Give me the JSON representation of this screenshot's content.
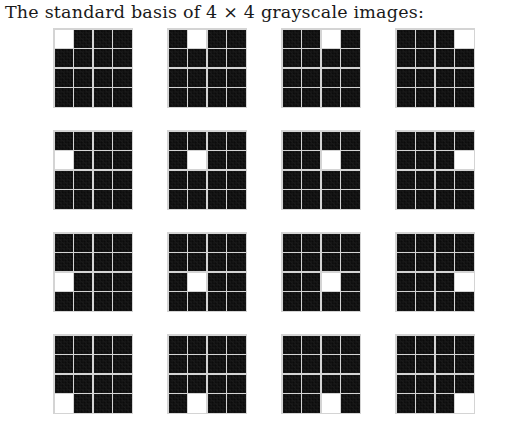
{
  "caption": {
    "text": "The standard basis of 4 × 4 grayscale images:"
  },
  "figure": {
    "grid_rows": 4,
    "grid_cols": 4,
    "image_rows": 4,
    "image_cols": 4,
    "on_color": "#ffffff",
    "off_color": "#0b0b0b",
    "gridline_color": "#d4d4d4",
    "background_color": "#ffffff"
  },
  "chart_data": {
    "type": "heatmap",
    "title": "The standard basis of 4 × 4 grayscale images:",
    "xlabel": "",
    "ylabel": "",
    "panel_layout": [
      4,
      4
    ],
    "matrix_shape": [
      4,
      4
    ],
    "value_range": [
      0,
      1
    ],
    "panels": [
      {
        "name": "E11",
        "panel_row": 0,
        "panel_col": 0,
        "on_pixel": [
          0,
          0
        ],
        "values": [
          [
            1,
            0,
            0,
            0
          ],
          [
            0,
            0,
            0,
            0
          ],
          [
            0,
            0,
            0,
            0
          ],
          [
            0,
            0,
            0,
            0
          ]
        ]
      },
      {
        "name": "E12",
        "panel_row": 0,
        "panel_col": 1,
        "on_pixel": [
          0,
          1
        ],
        "values": [
          [
            0,
            1,
            0,
            0
          ],
          [
            0,
            0,
            0,
            0
          ],
          [
            0,
            0,
            0,
            0
          ],
          [
            0,
            0,
            0,
            0
          ]
        ]
      },
      {
        "name": "E13",
        "panel_row": 0,
        "panel_col": 2,
        "on_pixel": [
          0,
          2
        ],
        "values": [
          [
            0,
            0,
            1,
            0
          ],
          [
            0,
            0,
            0,
            0
          ],
          [
            0,
            0,
            0,
            0
          ],
          [
            0,
            0,
            0,
            0
          ]
        ]
      },
      {
        "name": "E14",
        "panel_row": 0,
        "panel_col": 3,
        "on_pixel": [
          0,
          3
        ],
        "values": [
          [
            0,
            0,
            0,
            1
          ],
          [
            0,
            0,
            0,
            0
          ],
          [
            0,
            0,
            0,
            0
          ],
          [
            0,
            0,
            0,
            0
          ]
        ]
      },
      {
        "name": "E21",
        "panel_row": 1,
        "panel_col": 0,
        "on_pixel": [
          1,
          0
        ],
        "values": [
          [
            0,
            0,
            0,
            0
          ],
          [
            1,
            0,
            0,
            0
          ],
          [
            0,
            0,
            0,
            0
          ],
          [
            0,
            0,
            0,
            0
          ]
        ]
      },
      {
        "name": "E22",
        "panel_row": 1,
        "panel_col": 1,
        "on_pixel": [
          1,
          1
        ],
        "values": [
          [
            0,
            0,
            0,
            0
          ],
          [
            0,
            1,
            0,
            0
          ],
          [
            0,
            0,
            0,
            0
          ],
          [
            0,
            0,
            0,
            0
          ]
        ]
      },
      {
        "name": "E23",
        "panel_row": 1,
        "panel_col": 2,
        "on_pixel": [
          1,
          2
        ],
        "values": [
          [
            0,
            0,
            0,
            0
          ],
          [
            0,
            0,
            1,
            0
          ],
          [
            0,
            0,
            0,
            0
          ],
          [
            0,
            0,
            0,
            0
          ]
        ]
      },
      {
        "name": "E24",
        "panel_row": 1,
        "panel_col": 3,
        "on_pixel": [
          1,
          3
        ],
        "values": [
          [
            0,
            0,
            0,
            0
          ],
          [
            0,
            0,
            0,
            1
          ],
          [
            0,
            0,
            0,
            0
          ],
          [
            0,
            0,
            0,
            0
          ]
        ]
      },
      {
        "name": "E31",
        "panel_row": 2,
        "panel_col": 0,
        "on_pixel": [
          2,
          0
        ],
        "values": [
          [
            0,
            0,
            0,
            0
          ],
          [
            0,
            0,
            0,
            0
          ],
          [
            1,
            0,
            0,
            0
          ],
          [
            0,
            0,
            0,
            0
          ]
        ]
      },
      {
        "name": "E32",
        "panel_row": 2,
        "panel_col": 1,
        "on_pixel": [
          2,
          1
        ],
        "values": [
          [
            0,
            0,
            0,
            0
          ],
          [
            0,
            0,
            0,
            0
          ],
          [
            0,
            1,
            0,
            0
          ],
          [
            0,
            0,
            0,
            0
          ]
        ]
      },
      {
        "name": "E33",
        "panel_row": 2,
        "panel_col": 2,
        "on_pixel": [
          2,
          2
        ],
        "values": [
          [
            0,
            0,
            0,
            0
          ],
          [
            0,
            0,
            0,
            0
          ],
          [
            0,
            0,
            1,
            0
          ],
          [
            0,
            0,
            0,
            0
          ]
        ]
      },
      {
        "name": "E34",
        "panel_row": 2,
        "panel_col": 3,
        "on_pixel": [
          2,
          3
        ],
        "values": [
          [
            0,
            0,
            0,
            0
          ],
          [
            0,
            0,
            0,
            0
          ],
          [
            0,
            0,
            0,
            1
          ],
          [
            0,
            0,
            0,
            0
          ]
        ]
      },
      {
        "name": "E41",
        "panel_row": 3,
        "panel_col": 0,
        "on_pixel": [
          3,
          0
        ],
        "values": [
          [
            0,
            0,
            0,
            0
          ],
          [
            0,
            0,
            0,
            0
          ],
          [
            0,
            0,
            0,
            0
          ],
          [
            1,
            0,
            0,
            0
          ]
        ]
      },
      {
        "name": "E42",
        "panel_row": 3,
        "panel_col": 1,
        "on_pixel": [
          3,
          1
        ],
        "values": [
          [
            0,
            0,
            0,
            0
          ],
          [
            0,
            0,
            0,
            0
          ],
          [
            0,
            0,
            0,
            0
          ],
          [
            0,
            1,
            0,
            0
          ]
        ]
      },
      {
        "name": "E43",
        "panel_row": 3,
        "panel_col": 2,
        "on_pixel": [
          3,
          2
        ],
        "values": [
          [
            0,
            0,
            0,
            0
          ],
          [
            0,
            0,
            0,
            0
          ],
          [
            0,
            0,
            0,
            0
          ],
          [
            0,
            0,
            1,
            0
          ]
        ]
      },
      {
        "name": "E44",
        "panel_row": 3,
        "panel_col": 3,
        "on_pixel": [
          3,
          3
        ],
        "values": [
          [
            0,
            0,
            0,
            0
          ],
          [
            0,
            0,
            0,
            0
          ],
          [
            0,
            0,
            0,
            0
          ],
          [
            0,
            0,
            0,
            1
          ]
        ]
      }
    ]
  }
}
